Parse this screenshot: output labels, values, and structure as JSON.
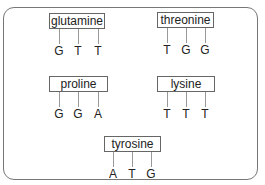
{
  "diagram": {
    "codons": [
      {
        "amino_acid": "glutamine",
        "bases": [
          "G",
          "T",
          "T"
        ]
      },
      {
        "amino_acid": "threonine",
        "bases": [
          "T",
          "G",
          "G"
        ]
      },
      {
        "amino_acid": "proline",
        "bases": [
          "G",
          "G",
          "A"
        ]
      },
      {
        "amino_acid": "lysine",
        "bases": [
          "T",
          "T",
          "T"
        ]
      },
      {
        "amino_acid": "tyrosine",
        "bases": [
          "A",
          "T",
          "G"
        ]
      }
    ]
  }
}
